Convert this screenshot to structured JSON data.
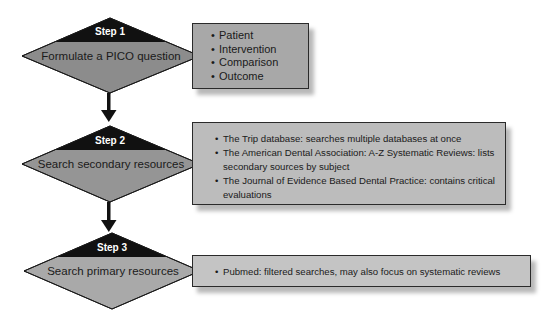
{
  "colors": {
    "step_band": "#111111",
    "step1_diamond_fill": "#8c8c8c",
    "step2_diamond_fill": "#959595",
    "step3_diamond_fill": "#a9a9a9",
    "step1_box_fill": "#a8a8a8",
    "step2_box_fill": "#bcbcbc",
    "step3_box_fill": "#c4c4c4",
    "arrow": "#111111"
  },
  "steps": [
    {
      "step_label": "Step 1",
      "title": "Formulate a PICO question",
      "details": [
        "Patient",
        "Intervention",
        "Comparison",
        "Outcome"
      ]
    },
    {
      "step_label": "Step 2",
      "title": "Search secondary resources",
      "details": [
        "The Trip database: searches multiple databases at once",
        "The American Dental Association: A-Z Systematic Reviews: lists secondary sources by subject",
        "The Journal of Evidence Based Dental Practice: contains critical evaluations"
      ]
    },
    {
      "step_label": "Step 3",
      "title": "Search primary resources",
      "details": [
        "Pubmed: filtered searches, may also focus on systematic reviews"
      ]
    }
  ]
}
